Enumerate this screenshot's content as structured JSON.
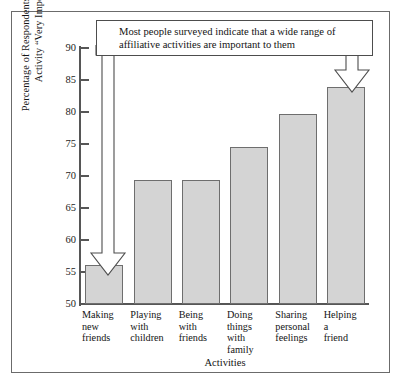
{
  "chart_data": {
    "type": "bar",
    "title": "",
    "xlabel": "Activities",
    "ylabel": "Percentage of Respondents Rating Each Activity “Very Important”",
    "categories": [
      "Making new friends",
      "Playing with children",
      "Being with friends",
      "Doing things with family",
      "Sharing personal feelings",
      "Helping a friend"
    ],
    "category_lines": [
      [
        "Making",
        "new",
        "friends"
      ],
      [
        "Playing",
        "with",
        "children"
      ],
      [
        "Being",
        "with",
        "friends"
      ],
      [
        "Doing",
        "things",
        "with",
        "family"
      ],
      [
        "Sharing",
        "personal",
        "feelings"
      ],
      [
        "Helping",
        "a",
        "friend"
      ]
    ],
    "values": [
      56.1,
      69.3,
      69.4,
      74.6,
      79.7,
      83.9
    ],
    "ylim": [
      50,
      90
    ],
    "yticks": [
      50,
      55,
      60,
      65,
      70,
      75,
      80,
      85,
      90
    ],
    "ytick_labels": [
      "50",
      "55",
      "60",
      "65",
      "70",
      "75",
      "80",
      "85",
      "90"
    ],
    "grid": false,
    "legend": null,
    "bar_color": "#d4d4d4",
    "bar_edge_color": "#6e6e6e",
    "axis_color": "#565656"
  },
  "annotation": {
    "text": "Most people surveyed indicate that a wide range of affiliative activities are important to them",
    "border_color": "#4d4d4d",
    "points_to": [
      "Making new friends",
      "Helping a friend"
    ],
    "arrow_count": 2
  },
  "frame": {
    "border_color": "#6b6b6b"
  }
}
